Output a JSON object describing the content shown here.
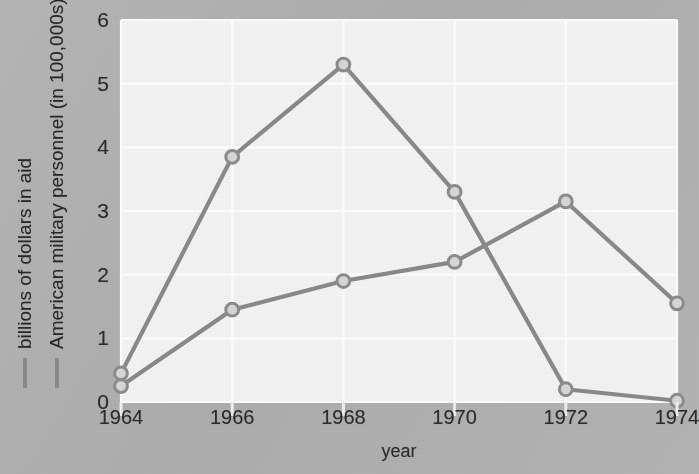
{
  "chart_data": {
    "type": "line",
    "title": "",
    "subtitle": "",
    "xlabel": "year",
    "ylabel": "",
    "x": [
      1964,
      1966,
      1968,
      1970,
      1972,
      1974
    ],
    "categories": [
      "1964",
      "1966",
      "1968",
      "1970",
      "1972",
      "1974"
    ],
    "xlim": [
      1964,
      1974
    ],
    "ylim": [
      0,
      6
    ],
    "y_ticks": [
      0,
      1,
      2,
      3,
      4,
      5,
      6
    ],
    "y_tick_labels": [
      "0",
      "1",
      "2",
      "3",
      "4",
      "5",
      "6"
    ],
    "x_ticks": [
      1964,
      1966,
      1968,
      1970,
      1972,
      1974
    ],
    "x_tick_labels": [
      "1964",
      "1966",
      "1968",
      "1970",
      "1972",
      "1974"
    ],
    "grid": true,
    "grid_color": "#ffffff",
    "legend_position": "left-outside-rotated",
    "plot_background": "#f4f4f4",
    "figure_background": "#b2b2b2",
    "markers": "circle-open",
    "series": [
      {
        "name": "billions of dollars in aid",
        "color": "#8a8a8a",
        "values": [
          0.45,
          3.85,
          5.3,
          3.3,
          0.2,
          0.02
        ]
      },
      {
        "name": "American military personnel (in 100,000s)",
        "color": "#8a8a8a",
        "values": [
          0.25,
          1.45,
          1.9,
          2.2,
          3.15,
          1.55
        ]
      }
    ]
  },
  "axes": {
    "x_title": "year"
  },
  "legend": {
    "entries": [
      {
        "label": "billions of dollars in aid",
        "color": "#8a8a8a"
      },
      {
        "label": "American military personnel (in 100,000s)",
        "color": "#8a8a8a"
      }
    ]
  },
  "colors": {
    "series_line": "#8a8a8a",
    "marker_fill": "#d8d8d8",
    "marker_stroke": "#8d8d8d",
    "grid": "#ffffff",
    "plot_bg": "#f4f4f4",
    "figure_bg": "#b2b2b2",
    "text": "#2b2b2b"
  }
}
